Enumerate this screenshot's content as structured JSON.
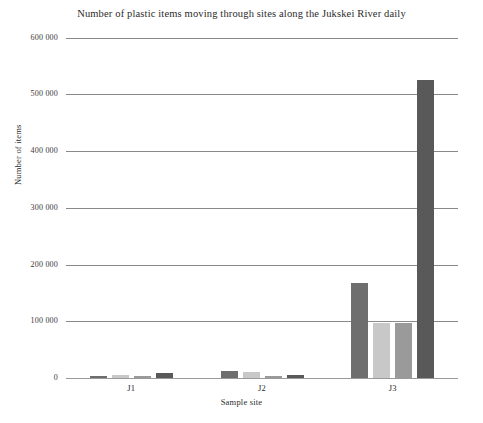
{
  "chart_data": {
    "type": "bar",
    "title": "Number of plastic items moving through sites along the Jukskei River daily",
    "xlabel": "Sample site",
    "ylabel": "Number of items",
    "categories": [
      "J1",
      "J2",
      "J3"
    ],
    "ylim": [
      0,
      600000
    ],
    "yticks": [
      0,
      100000,
      200000,
      300000,
      400000,
      500000,
      600000
    ],
    "ytick_labels": [
      "0",
      "100 000",
      "200 000",
      "300 000",
      "400 000",
      "500 000",
      "600 000"
    ],
    "grid": true,
    "legend": "none",
    "series": [
      {
        "name": "series-1",
        "color": "#6e6e6e",
        "values": [
          4000,
          13000,
          167000
        ]
      },
      {
        "name": "series-2",
        "color": "#c8c8c8",
        "values": [
          5500,
          10000,
          97000
        ]
      },
      {
        "name": "series-3",
        "color": "#9a9a9a",
        "values": [
          3500,
          4000,
          97000
        ]
      },
      {
        "name": "series-4",
        "color": "#595959",
        "values": [
          8000,
          5000,
          525000
        ]
      }
    ]
  },
  "colors": {
    "axis": "#8a8a8a",
    "text": "#2b2b2b",
    "background": "#ffffff"
  }
}
